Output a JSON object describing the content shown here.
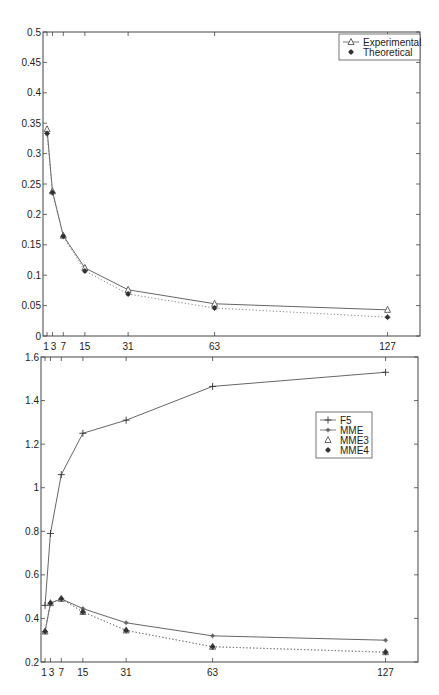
{
  "chart_data": [
    {
      "type": "line",
      "title": "",
      "xlabel": "",
      "ylabel": "",
      "x": [
        1,
        3,
        7,
        15,
        31,
        63,
        127
      ],
      "xticks": [
        "1",
        "3",
        "7",
        "15",
        "31",
        "63",
        "127"
      ],
      "yticks": [
        "0",
        "0.05",
        "0.1",
        "0.15",
        "0.2",
        "0.25",
        "0.3",
        "0.35",
        "0.4",
        "0.45",
        "0.5"
      ],
      "ylim": [
        0,
        0.5
      ],
      "xlim": [
        -0.5,
        139
      ],
      "grid": false,
      "legend_position": "upper right",
      "series": [
        {
          "name": "Experimental",
          "marker": "triangle",
          "line": "solid",
          "values": [
            0.34,
            0.238,
            0.165,
            0.112,
            0.076,
            0.053,
            0.043
          ]
        },
        {
          "name": "Theoretical",
          "marker": "asterisk",
          "line": "dotted",
          "values": [
            0.333,
            0.236,
            0.164,
            0.107,
            0.069,
            0.046,
            0.031
          ]
        }
      ]
    },
    {
      "type": "line",
      "title": "",
      "xlabel": "",
      "ylabel": "",
      "x": [
        1,
        3,
        7,
        15,
        31,
        63,
        127
      ],
      "xticks": [
        "1",
        "3",
        "7",
        "15",
        "31",
        "63",
        "127"
      ],
      "yticks": [
        "0.2",
        "0.4",
        "0.6",
        "0.8",
        "1",
        "1.2",
        "1.4",
        "1.6"
      ],
      "ylim": [
        0.2,
        1.6
      ],
      "xlim": [
        -0.5,
        139
      ],
      "grid": false,
      "legend_position": "center right",
      "series": [
        {
          "name": "F5",
          "marker": "plus",
          "line": "solid",
          "values": [
            0.46,
            0.79,
            1.06,
            1.25,
            1.31,
            1.465,
            1.53
          ]
        },
        {
          "name": "MME",
          "marker": "dot",
          "line": "solid",
          "values": [
            0.34,
            0.47,
            0.49,
            0.445,
            0.38,
            0.32,
            0.3
          ]
        },
        {
          "name": "MME3",
          "marker": "triangle",
          "line": "dotted",
          "values": [
            0.34,
            0.47,
            0.49,
            0.43,
            0.345,
            0.27,
            0.245
          ]
        },
        {
          "name": "MME4",
          "marker": "asterisk",
          "line": "dotted",
          "values": [
            0.34,
            0.47,
            0.49,
            0.43,
            0.345,
            0.27,
            0.245
          ]
        }
      ]
    }
  ]
}
